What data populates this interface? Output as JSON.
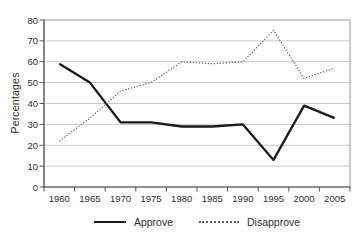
{
  "chart_data": {
    "type": "line",
    "title": "",
    "xlabel": "",
    "ylabel": "Percentages",
    "categories": [
      "1960",
      "1965",
      "1970",
      "1975",
      "1980",
      "1985",
      "1990",
      "1995",
      "2000",
      "2005"
    ],
    "yticks": [
      0,
      10,
      20,
      30,
      40,
      50,
      60,
      70,
      80
    ],
    "ylim": [
      0,
      80
    ],
    "grid": true,
    "legend_position": "bottom",
    "series": [
      {
        "name": "Approve",
        "line_style": "solid",
        "color": "#1a1a1a",
        "values": [
          59,
          50,
          31,
          31,
          29,
          29,
          30,
          13,
          39,
          33
        ]
      },
      {
        "name": "Disapprove",
        "line_style": "dotted",
        "color": "#5f5f5f",
        "values": [
          22,
          33,
          46,
          50,
          60,
          59,
          60,
          75,
          52,
          57
        ]
      }
    ]
  }
}
